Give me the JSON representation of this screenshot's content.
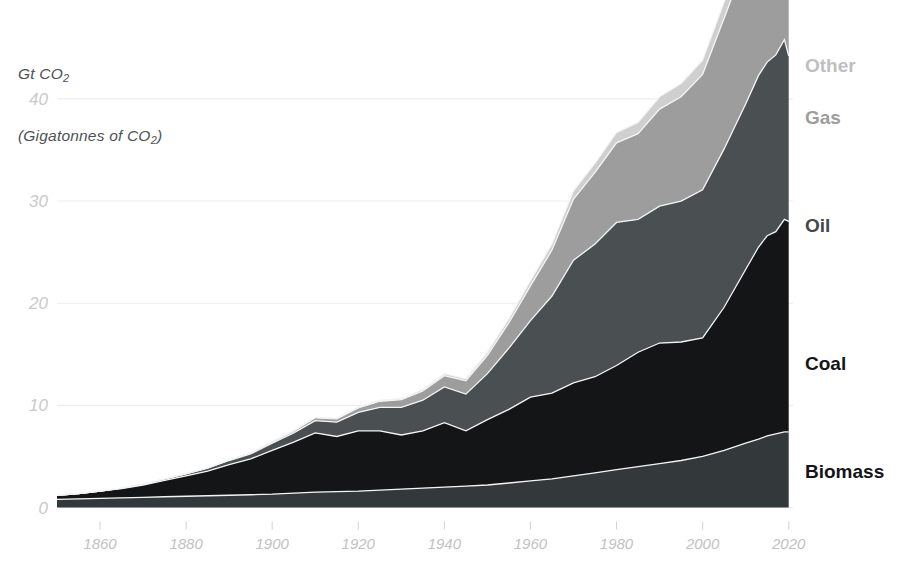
{
  "axis_title": {
    "line1": "Gt CO2",
    "line2": "(Gigatonnes of CO2)"
  },
  "colors": {
    "background": "#ffffff",
    "gridline": "#ededed",
    "tick_text": "#c5c5c5",
    "title_text": "#4d5255",
    "separator": "#f4f4f4",
    "biomass": "#33383b",
    "coal": "#141516",
    "oil": "#4a4f52",
    "gas": "#9d9d9d",
    "other": "#cfcfcf"
  },
  "legend": {
    "position": "right-inline",
    "entries": [
      {
        "label": "Other",
        "color": "#bfbfbf",
        "y": 72
      },
      {
        "label": "Gas",
        "color": "#9d9d9d",
        "y": 124
      },
      {
        "label": "Oil",
        "color": "#43484b",
        "y": 232
      },
      {
        "label": "Coal",
        "color": "#141516",
        "y": 370
      },
      {
        "label": "Biomass",
        "color": "#141516",
        "y": 478
      }
    ]
  },
  "chart_data": {
    "type": "area",
    "stacked": true,
    "title": "",
    "subtitle": "",
    "xlabel": "",
    "ylabel": "Gt CO2 (Gigatonnes of CO2)",
    "grid": true,
    "xlim": [
      1850,
      2021
    ],
    "ylim": [
      0,
      44
    ],
    "yticks": [
      0,
      10,
      20,
      30,
      40
    ],
    "ytick_labels": [
      "0",
      "10",
      "20",
      "30",
      "40"
    ],
    "xticks": [
      1860,
      1880,
      1900,
      1920,
      1940,
      1960,
      1980,
      2000,
      2020
    ],
    "xtick_labels": [
      "1860",
      "1880",
      "1900",
      "1920",
      "1940",
      "1960",
      "1980",
      "2000",
      "2020"
    ],
    "stack_order_bottom_to_top": [
      "Biomass",
      "Coal",
      "Oil",
      "Gas",
      "Other"
    ],
    "x": [
      1850,
      1855,
      1860,
      1865,
      1870,
      1875,
      1880,
      1885,
      1890,
      1895,
      1900,
      1905,
      1910,
      1915,
      1920,
      1925,
      1930,
      1935,
      1940,
      1945,
      1950,
      1955,
      1960,
      1965,
      1970,
      1975,
      1980,
      1985,
      1990,
      1995,
      2000,
      2005,
      2010,
      2013,
      2015,
      2017,
      2019,
      2020
    ],
    "series": [
      {
        "name": "Biomass",
        "color": "#33383b",
        "values": [
          0.8,
          0.85,
          0.9,
          0.95,
          1.0,
          1.05,
          1.1,
          1.15,
          1.2,
          1.25,
          1.3,
          1.4,
          1.5,
          1.55,
          1.6,
          1.7,
          1.8,
          1.9,
          2.0,
          2.1,
          2.2,
          2.4,
          2.6,
          2.8,
          3.1,
          3.4,
          3.7,
          4.0,
          4.3,
          4.6,
          5.0,
          5.6,
          6.3,
          6.7,
          7.0,
          7.2,
          7.4,
          7.4
        ]
      },
      {
        "name": "Coal",
        "color": "#141516",
        "values": [
          0.4,
          0.5,
          0.7,
          0.9,
          1.2,
          1.6,
          2.0,
          2.4,
          3.0,
          3.5,
          4.3,
          5.0,
          5.8,
          5.4,
          5.9,
          5.8,
          5.3,
          5.6,
          6.3,
          5.4,
          6.4,
          7.2,
          8.2,
          8.4,
          9.1,
          9.4,
          10.2,
          11.2,
          11.8,
          11.6,
          11.6,
          14.0,
          17.0,
          18.8,
          19.6,
          19.8,
          20.8,
          20.6
        ]
      },
      {
        "name": "Oil",
        "color": "#4a4f52",
        "values": [
          0.0,
          0.0,
          0.0,
          0.05,
          0.1,
          0.15,
          0.2,
          0.3,
          0.4,
          0.5,
          0.7,
          0.9,
          1.2,
          1.4,
          1.8,
          2.3,
          2.7,
          3.0,
          3.5,
          3.6,
          4.5,
          6.0,
          7.5,
          9.5,
          12.0,
          13.0,
          14.0,
          13.0,
          13.4,
          13.8,
          14.5,
          15.5,
          16.2,
          16.8,
          17.0,
          17.3,
          17.6,
          16.2
        ]
      },
      {
        "name": "Gas",
        "color": "#9d9d9d",
        "values": [
          0.0,
          0.0,
          0.0,
          0.0,
          0.0,
          0.0,
          0.02,
          0.04,
          0.07,
          0.1,
          0.14,
          0.2,
          0.28,
          0.34,
          0.45,
          0.6,
          0.75,
          0.9,
          1.1,
          1.3,
          1.8,
          2.5,
          3.4,
          4.5,
          6.0,
          7.0,
          7.8,
          8.4,
          9.5,
          10.2,
          11.3,
          12.8,
          14.0,
          14.8,
          15.2,
          15.8,
          16.4,
          16.0
        ]
      },
      {
        "name": "Other",
        "color": "#cfcfcf",
        "values": [
          0.0,
          0.0,
          0.0,
          0.0,
          0.0,
          0.0,
          0.0,
          0.0,
          0.0,
          0.0,
          0.02,
          0.03,
          0.05,
          0.06,
          0.08,
          0.1,
          0.12,
          0.15,
          0.2,
          0.2,
          0.3,
          0.4,
          0.5,
          0.6,
          0.8,
          0.9,
          1.0,
          1.1,
          1.2,
          1.3,
          1.4,
          1.6,
          1.8,
          1.9,
          2.0,
          2.1,
          2.2,
          2.1
        ]
      }
    ],
    "totals_note": {
      "peak_total": 43.5,
      "peak_year": 2019,
      "final_total": 41.0
    }
  }
}
